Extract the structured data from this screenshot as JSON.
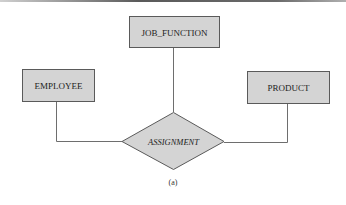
{
  "diagram": {
    "type": "er-diagram",
    "entities": [
      {
        "id": "job_function",
        "label": "JOB_FUNCTION"
      },
      {
        "id": "employee",
        "label": "EMPLOYEE"
      },
      {
        "id": "product",
        "label": "PRODUCT"
      }
    ],
    "relationship": {
      "id": "assignment",
      "label": "ASSIGNMENT"
    },
    "connections": [
      {
        "from": "employee",
        "to": "assignment"
      },
      {
        "from": "job_function",
        "to": "assignment"
      },
      {
        "from": "product",
        "to": "assignment"
      }
    ],
    "caption": "(a)"
  },
  "colors": {
    "shape_fill": "#d4d4d4",
    "shape_stroke": "#5a5a5a",
    "line": "#6e6e6e",
    "text": "#222222"
  }
}
